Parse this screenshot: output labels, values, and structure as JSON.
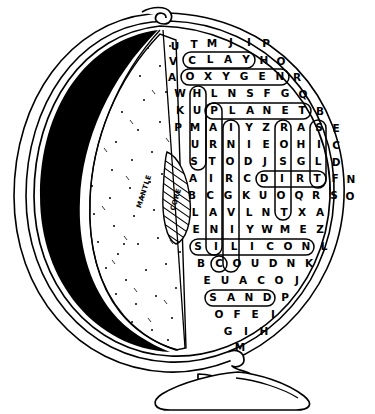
{
  "globe": {
    "labels": [
      {
        "name": "mantle-label",
        "text": "MANTLE"
      },
      {
        "name": "core-label",
        "text": "CORE"
      }
    ],
    "parts": {
      "crust_shell": "globe-shell",
      "stand": "globe-stand",
      "base": "globe-base",
      "pivot": "globe-pivot"
    }
  },
  "puzzle": {
    "type": "word-search",
    "rows": [
      [
        "U",
        "T",
        "M",
        "J",
        "I",
        "P"
      ],
      [
        "V",
        "C",
        "L",
        "A",
        "Y",
        "H",
        "O"
      ],
      [
        "A",
        "O",
        "X",
        "Y",
        "G",
        "E",
        "N",
        "R"
      ],
      [
        "W",
        "H",
        "L",
        "N",
        "S",
        "F",
        "G",
        "Q"
      ],
      [
        "K",
        "U",
        "P",
        "L",
        "A",
        "N",
        "E",
        "T",
        "B"
      ],
      [
        "P",
        "M",
        "A",
        "I",
        "Y",
        "Z",
        "R",
        "A",
        "S",
        "E"
      ],
      [
        "U",
        "R",
        "N",
        "I",
        "E",
        "O",
        "H",
        "I",
        "C"
      ],
      [
        "S",
        "T",
        "O",
        "D",
        "J",
        "S",
        "G",
        "L",
        "D"
      ],
      [
        "A",
        "I",
        "R",
        "C",
        "D",
        "I",
        "R",
        "T",
        "F",
        "N"
      ],
      [
        "B",
        "C",
        "G",
        "K",
        "U",
        "O",
        "Q",
        "R",
        "S",
        "O"
      ],
      [
        "L",
        "A",
        "V",
        "L",
        "N",
        "T",
        "X",
        "A"
      ],
      [
        "E",
        "N",
        "I",
        "Y",
        "W",
        "M",
        "E",
        "Z"
      ],
      [
        "S",
        "I",
        "L",
        "I",
        "C",
        "O",
        "N",
        "L"
      ],
      [
        "B",
        "C",
        "O",
        "U",
        "D",
        "N",
        "K"
      ],
      [
        "E",
        "U",
        "A",
        "C",
        "O",
        "J"
      ],
      [
        "S",
        "A",
        "N",
        "D",
        "P"
      ],
      [
        "O",
        "F",
        "E",
        "I"
      ],
      [
        "G",
        "I",
        "H"
      ],
      [
        "M"
      ]
    ],
    "found_words": [
      {
        "word": "CLAY",
        "direction": "horizontal"
      },
      {
        "word": "OXYGEN",
        "direction": "horizontal"
      },
      {
        "word": "PLANET",
        "direction": "horizontal"
      },
      {
        "word": "DIRT",
        "direction": "horizontal"
      },
      {
        "word": "SILICON",
        "direction": "horizontal"
      },
      {
        "word": "SAND",
        "direction": "horizontal"
      },
      {
        "word": "HUMUS",
        "direction": "vertical"
      },
      {
        "word": "PARTICLES",
        "direction": "vertical"
      },
      {
        "word": "INORGANIC",
        "direction": "vertical"
      },
      {
        "word": "EROSION",
        "direction": "vertical"
      },
      {
        "word": "SILT",
        "direction": "vertical"
      },
      {
        "word": "TRAP",
        "direction": "vertical"
      }
    ]
  }
}
